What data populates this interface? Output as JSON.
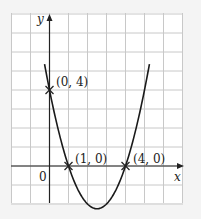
{
  "chart_data": {
    "type": "line",
    "title": "",
    "function": "y = (x - 1)(x - 4) = x^2 - 5x + 4",
    "xlabel": "x",
    "ylabel": "y",
    "origin_label": "0",
    "xlim": [
      -2,
      7
    ],
    "ylim": [
      -2,
      8
    ],
    "grid": true,
    "grid_step": 1,
    "series": [
      {
        "name": "parabola",
        "x_range": [
          -0.26,
          5.26
        ]
      }
    ],
    "points": [
      {
        "x": 0,
        "y": 4,
        "label": "(0, 4)"
      },
      {
        "x": 1,
        "y": 0,
        "label": "(1, 0)"
      },
      {
        "x": 4,
        "y": 0,
        "label": "(4, 0)"
      }
    ],
    "colors": {
      "background": "#f4f4f4",
      "panel": "#ffffff",
      "grid": "#c8c8c8",
      "axis": "#222222",
      "curve": "#1a1a1a"
    }
  },
  "labels": {
    "y_axis": "y",
    "x_axis": "x",
    "origin": "0",
    "p1": "(0, 4)",
    "p2": "(1, 0)",
    "p3": "(4, 0)"
  }
}
